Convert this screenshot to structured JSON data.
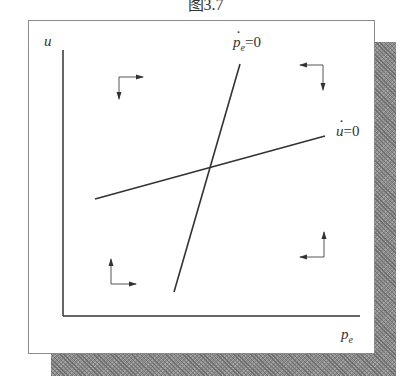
{
  "caption": "图3.7",
  "axes": {
    "y_label": "u",
    "x_label": "p",
    "x_label_sub": "e"
  },
  "curves": [
    {
      "name": "pe-dot-zero",
      "label_var": "p",
      "label_sub": "e",
      "label_eq": "=0",
      "from": [
        174,
        292
      ],
      "to": [
        240,
        64
      ]
    },
    {
      "name": "u-dot-zero",
      "label_var": "u",
      "label_eq": "=0",
      "from": [
        95,
        199
      ],
      "to": [
        325,
        136
      ]
    }
  ],
  "colors": {
    "line": "#333333",
    "frame": "#8a8a8a",
    "shadow": "#7a7a7a"
  }
}
